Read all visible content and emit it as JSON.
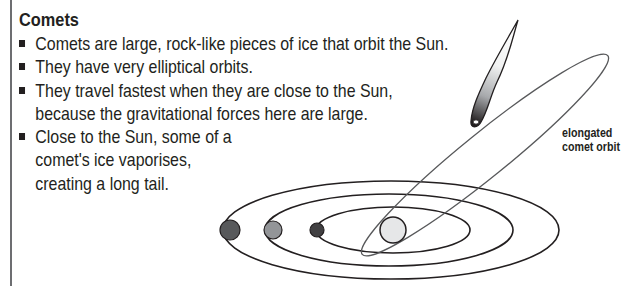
{
  "title": "Comets",
  "bullets": [
    {
      "lines": [
        "Comets are large, rock-like pieces of ice that orbit the Sun."
      ]
    },
    {
      "lines": [
        "They have very elliptical orbits."
      ]
    },
    {
      "lines": [
        "They travel fastest when they are close to the Sun,",
        "because the gravitational forces here are large."
      ]
    },
    {
      "lines": [
        "Close to the Sun, some of a",
        "comet's ice vaporises,",
        "creating a long tail."
      ]
    }
  ],
  "diagram": {
    "label": {
      "line1": "elongated",
      "line2": "comet orbit"
    },
    "sun": {
      "cx": 393,
      "cy": 230,
      "r": 13,
      "fill": "#e6e7e8"
    },
    "orbits": [
      {
        "cx": 391,
        "cy": 230,
        "rx": 168,
        "ry": 49
      },
      {
        "cx": 389,
        "cy": 230,
        "rx": 124,
        "ry": 36
      },
      {
        "cx": 393,
        "cy": 230,
        "rx": 77,
        "ry": 23
      }
    ],
    "planets": [
      {
        "cx": 230,
        "cy": 230,
        "r": 10,
        "fill": "#58595b"
      },
      {
        "cx": 273,
        "cy": 230,
        "r": 9,
        "fill": "#939598"
      },
      {
        "cx": 317,
        "cy": 230,
        "r": 7,
        "fill": "#414042"
      }
    ],
    "colors": {
      "stroke": "#231f20",
      "comet_orbit": "#58595b"
    }
  }
}
